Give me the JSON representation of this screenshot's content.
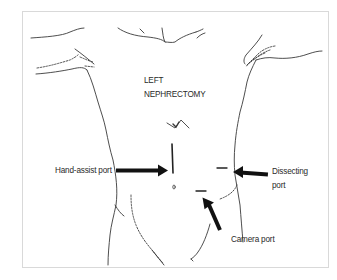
{
  "figure": {
    "title_line1": "LEFT",
    "title_line2": "NEPHRECTOMY",
    "labels": {
      "hand_assist": "Hand-assist port",
      "dissecting_line1": "Dissecting",
      "dissecting_line2": "port",
      "camera": "Camera port"
    },
    "colors": {
      "outline": "#3a3a3a",
      "arrow": "#111111",
      "frame": "#d9d9d9",
      "text": "#2a2a2a"
    }
  }
}
